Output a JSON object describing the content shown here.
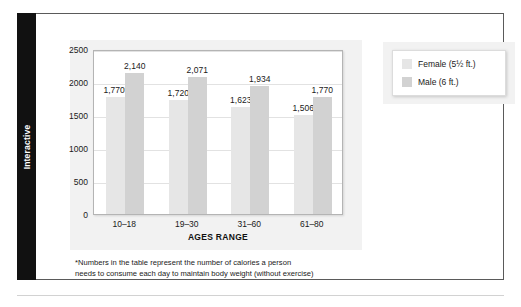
{
  "sidebar": {
    "tab_label": "Interactive"
  },
  "legend": {
    "items": [
      {
        "label": "Female (5½ ft.)",
        "color": "#e6e6e6",
        "swatch_name": "legend-swatch-female"
      },
      {
        "label": "Male (6 ft.)",
        "color": "#d2d2d2",
        "swatch_name": "legend-swatch-male"
      }
    ]
  },
  "footnote": {
    "line1": "*Numbers in the table represent the number of calories a person",
    "line2": "needs to consume each day to maintain body weight (without exercise)"
  },
  "colors": {
    "female_bar": "#e6e6e6",
    "male_bar": "#d2d2d2",
    "panel": "#f2f2f2",
    "plot_background": "#ffffff",
    "gridline": "#e2e2e2",
    "frame_border": "#5a5a5a",
    "tab_background": "#111111",
    "text": "#1a1a1a"
  },
  "chart_data": {
    "type": "bar",
    "title": "",
    "subtitle": "",
    "xlabel": "AGES RANGE",
    "ylabel": "",
    "categories": [
      "10–18",
      "19–30",
      "31–60",
      "61–80"
    ],
    "series": [
      {
        "name": "Female (5½ ft.)",
        "color": "#e6e6e6",
        "values": [
          1770,
          1720,
          1623,
          1506
        ],
        "labels": [
          "1,770*",
          "1,720",
          "1,623",
          "1,506"
        ]
      },
      {
        "name": "Male (6 ft.)",
        "color": "#d2d2d2",
        "values": [
          2140,
          2071,
          1934,
          1770
        ],
        "labels": [
          "2,140",
          "2,071",
          "1,934",
          "1,770"
        ]
      }
    ],
    "ylim": [
      0,
      2500
    ],
    "yticks": [
      0,
      500,
      1000,
      1500,
      2000,
      2500
    ],
    "ytick_labels": [
      "0",
      "500",
      "1000",
      "1500",
      "2000",
      "2500"
    ],
    "grid": true,
    "legend_position": "right"
  }
}
